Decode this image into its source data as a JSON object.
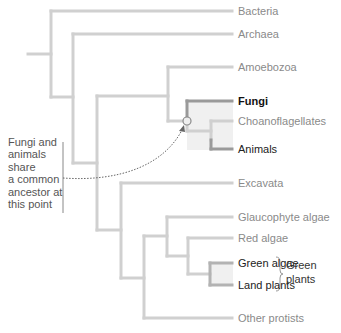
{
  "diagram": {
    "type": "phylogenetic-tree",
    "colors": {
      "branch": "#cfcfcf",
      "highlight_branch": "#8c8c8c",
      "clade_shade": "#f0f0f0",
      "annotation_line": "#888888"
    },
    "taxa": [
      {
        "id": "bacteria",
        "label": "Bacteria",
        "style": "muted"
      },
      {
        "id": "archaea",
        "label": "Archaea",
        "style": "muted"
      },
      {
        "id": "amoebozoa",
        "label": "Amoebozoa",
        "style": "muted"
      },
      {
        "id": "fungi",
        "label": "Fungi",
        "style": "bold"
      },
      {
        "id": "choanoflagellates",
        "label": "Choanoflagellates",
        "style": "muted"
      },
      {
        "id": "animals",
        "label": "Animals",
        "style": "dark"
      },
      {
        "id": "excavata",
        "label": "Excavata",
        "style": "muted"
      },
      {
        "id": "glaucophyte",
        "label": "Glaucophyte algae",
        "style": "muted"
      },
      {
        "id": "red_algae",
        "label": "Red algae",
        "style": "muted"
      },
      {
        "id": "green_algae",
        "label": "Green algae",
        "style": "dark"
      },
      {
        "id": "land_plants",
        "label": "Land plants",
        "style": "dark"
      },
      {
        "id": "other_protists",
        "label": "Other protists",
        "style": "muted"
      }
    ],
    "annotation": {
      "lines": [
        "Fungi and",
        "animals",
        "share",
        "a common",
        "ancestor at",
        "this point"
      ]
    },
    "group": {
      "label_lines": [
        "Green",
        "plants"
      ],
      "members": [
        "Green algae",
        "Land plants"
      ]
    }
  }
}
